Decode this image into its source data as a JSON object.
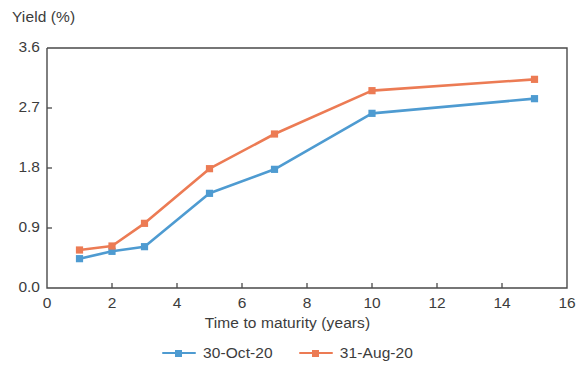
{
  "chart_data": {
    "type": "line",
    "title": "",
    "xlabel": "Time to maturity (years)",
    "ylabel": "Yield (%)",
    "xlim": [
      0,
      16
    ],
    "ylim": [
      0,
      3.6
    ],
    "xticks": [
      "0",
      "2",
      "4",
      "6",
      "8",
      "10",
      "12",
      "14",
      "16"
    ],
    "yticks": [
      "0.0",
      "0.9",
      "1.8",
      "2.7",
      "3.6"
    ],
    "grid": false,
    "legend_position": "bottom",
    "x": [
      1,
      2,
      3,
      5,
      7,
      10,
      15
    ],
    "series": [
      {
        "name": "30-Oct-20",
        "color": "#4E9BD1",
        "marker": "square",
        "values": [
          0.44,
          0.55,
          0.62,
          1.42,
          1.78,
          2.62,
          2.84
        ]
      },
      {
        "name": "31-Aug-20",
        "color": "#EC7B54",
        "marker": "square",
        "values": [
          0.57,
          0.63,
          0.97,
          1.79,
          2.31,
          2.96,
          3.13
        ]
      }
    ]
  },
  "legend": {
    "items": [
      {
        "label": "30-Oct-20",
        "color": "#4E9BD1"
      },
      {
        "label": "31-Aug-20",
        "color": "#EC7B54"
      }
    ]
  },
  "axes": {
    "y_title": "Yield (%)",
    "x_title": "Time to maturity (years)"
  }
}
